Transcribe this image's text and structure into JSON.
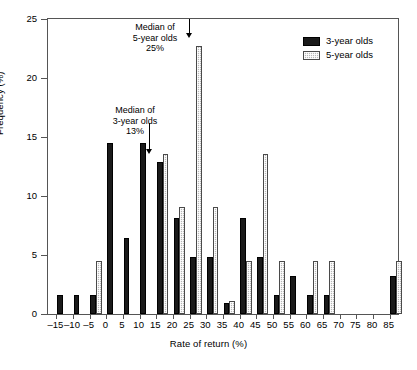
{
  "chart_data": {
    "type": "bar",
    "title": "",
    "xlabel": "Rate of return (%)",
    "ylabel": "Frequency (%)",
    "xlim": [
      -17.5,
      87.5
    ],
    "ylim": [
      0,
      25
    ],
    "yticks": [
      0,
      5,
      10,
      15,
      20,
      25
    ],
    "grid": false,
    "legend_position": "top-right",
    "categories": [
      "-15",
      "-10",
      "-5",
      "0",
      "5",
      "10",
      "15",
      "20",
      "25",
      "30",
      "35",
      "40",
      "45",
      "50",
      "55",
      "60",
      "65",
      "70",
      "75",
      "80",
      "85"
    ],
    "series": [
      {
        "name": "3-year olds",
        "color": "#1a1a1a",
        "values": [
          1.6,
          1.6,
          1.6,
          14.5,
          6.4,
          14.5,
          12.9,
          8.1,
          4.8,
          4.8,
          0.9,
          8.1,
          4.8,
          1.6,
          3.2,
          1.6,
          1.6,
          0,
          0,
          0,
          3.2
        ]
      },
      {
        "name": "5-year olds",
        "color": "#b8b8b8",
        "values": [
          0,
          0,
          4.5,
          0,
          0,
          0,
          13.6,
          9.1,
          22.7,
          9.1,
          1.1,
          4.5,
          13.6,
          4.5,
          0,
          4.5,
          4.5,
          0,
          0,
          0,
          4.5
        ]
      }
    ],
    "annotations": [
      {
        "id": "median-5-year-olds",
        "lines": [
          "Median of",
          "5-year olds",
          "25%"
        ],
        "target_x": 25,
        "target_y": 23.8
      },
      {
        "id": "median-3-year-olds",
        "lines": [
          "Median of",
          "3-year olds",
          "13%"
        ],
        "target_x": 13,
        "target_y": 13.5
      }
    ]
  },
  "legend": {
    "items": [
      {
        "label": "3-year olds",
        "swatch": "black-solid"
      },
      {
        "label": "5-year olds",
        "swatch": "grey-stipple"
      }
    ]
  },
  "axes": {
    "y_title": "Frequency (%)",
    "x_title": "Rate of return (%)",
    "y_tick_labels": [
      "0",
      "5",
      "10",
      "15",
      "20",
      "25"
    ],
    "x_tick_labels": [
      "–15",
      "–10",
      "–5",
      "0",
      "5",
      "10",
      "15",
      "20",
      "25",
      "30",
      "35",
      "40",
      "45",
      "50",
      "55",
      "60",
      "65",
      "70",
      "75",
      "80",
      "85"
    ]
  },
  "annotations": {
    "a0": {
      "l0": "Median of",
      "l1": "5-year olds",
      "l2": "25%"
    },
    "a1": {
      "l0": "Median of",
      "l1": "3-year olds",
      "l2": "13%"
    }
  }
}
